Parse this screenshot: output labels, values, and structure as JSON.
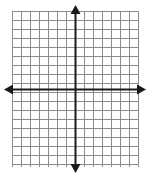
{
  "figure": {
    "name": "blank-coordinate-plane",
    "title": "Blank coordinate plane grid with x and y axes",
    "width": 149,
    "height": 177,
    "background_color": "#ffffff"
  },
  "chart_data": {
    "type": "scatter",
    "title": "",
    "subtitle": "",
    "xlabel": "",
    "ylabel": "",
    "series": [
      {
        "name": "",
        "x": [],
        "y": []
      }
    ],
    "x": [],
    "values": [],
    "categories": [],
    "annotations": [],
    "legend": {
      "entries": [],
      "position": "none",
      "visible": false
    },
    "grid": {
      "visible": true,
      "color": "#8c8c8c",
      "line_width": 1,
      "columns": 14,
      "rows": 17,
      "cell_size": 9,
      "x_tick_labels": [],
      "y_tick_labels": []
    },
    "xlim": [
      -8,
      6
    ],
    "ylim": [
      -9,
      8
    ],
    "axes": {
      "color": "#1a1a1a",
      "line_width": 2,
      "x_axis_visible": true,
      "y_axis_visible": true,
      "arrowheads": [
        "left",
        "right",
        "up",
        "down"
      ],
      "origin_x": 75,
      "origin_y": 89
    }
  },
  "grid_geometry": {
    "left": 12,
    "top": 11,
    "right": 138,
    "bottom": 167,
    "step": 9,
    "vertical_lines": 15,
    "horizontal_lines": 18
  },
  "axis_geometry": {
    "x_axis_y": 89,
    "y_axis_x": 75,
    "x_left_tip": 4,
    "x_right_tip": 146,
    "y_top_tip": 5,
    "y_bottom_tip": 173,
    "arrow_half_width": 5,
    "arrow_length": 9
  },
  "colors": {
    "grid_line": "#8c8c8c",
    "grid_line_light": "#a6a6a6",
    "axis": "#1a1a1a",
    "background": "#ffffff"
  }
}
